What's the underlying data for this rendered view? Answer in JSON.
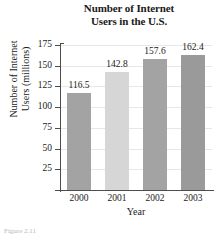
{
  "chart_data": {
    "type": "bar",
    "title": "Number of Internet Users in the U.S.",
    "title_lines": [
      "Number of Internet",
      "Users in the U.S."
    ],
    "xlabel": "Year",
    "ylabel": "Number of Internet Users (millions)",
    "ylabel_lines": [
      "Number of Internet",
      "Users (millions)"
    ],
    "categories": [
      "2000",
      "2001",
      "2002",
      "2003"
    ],
    "values": [
      116.5,
      142.8,
      157.6,
      162.4
    ],
    "value_labels": [
      "116.5",
      "142.8",
      "157.6",
      "162.4"
    ],
    "ylim": [
      0,
      175
    ],
    "ytick_labels": [
      "175",
      "150",
      "125",
      "100",
      "75",
      "50",
      "25"
    ],
    "yticks": [
      175,
      150,
      125,
      100,
      75,
      50,
      25
    ],
    "grid": true,
    "legend": "none",
    "bar_colors": [
      "#a3a3a3",
      "#d6d6d6",
      "#a3a3a3",
      "#9a9a9a"
    ],
    "colors": {
      "grid": "#e7e7e7",
      "axis": "#4d4d4d",
      "text": "#1a1a1a",
      "background": "#ffffff"
    }
  },
  "caption": "Figure 2.11"
}
